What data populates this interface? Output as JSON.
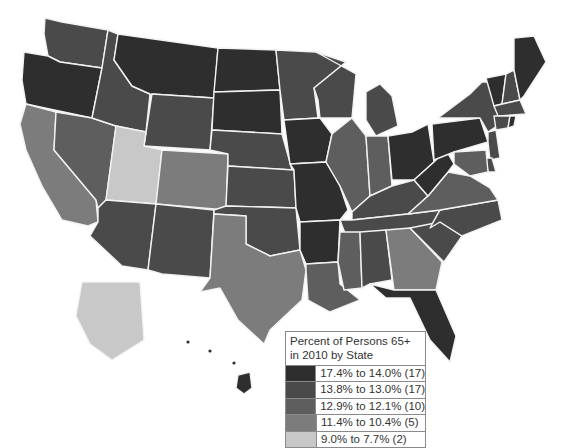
{
  "chart_data": {
    "type": "choropleth",
    "title": "Percent of Persons 65+ in 2010 by State",
    "legend": {
      "title": "Percent of Persons 65+ in 2010 by State",
      "placement": "bottom-right",
      "classes": [
        {
          "id": "c1",
          "label": "17.4% to 14.0% (17)",
          "range": [
            14.0,
            17.4
          ],
          "count": 17,
          "color": "#2e2e2e"
        },
        {
          "id": "c2",
          "label": "13.8% to 13.0% (17)",
          "range": [
            13.0,
            13.8
          ],
          "count": 17,
          "color": "#4a4a4a"
        },
        {
          "id": "c3",
          "label": "12.9% to 12.1% (10)",
          "range": [
            12.1,
            12.9
          ],
          "count": 10,
          "color": "#5e5e5e"
        },
        {
          "id": "c4",
          "label": "11.4% to 10.4% (5)",
          "range": [
            10.4,
            11.4
          ],
          "count": 5,
          "color": "#7c7c7c"
        },
        {
          "id": "c5",
          "label": "9.0% to 7.7% (2)",
          "range": [
            7.7,
            9.0
          ],
          "count": 2,
          "color": "#c8c8c8"
        }
      ]
    },
    "states": {
      "WA": "c2",
      "OR": "c1",
      "CA": "c4",
      "NV": "c3",
      "ID": "c2",
      "MT": "c1",
      "WY": "c2",
      "UT": "c5",
      "AZ": "c2",
      "CO": "c4",
      "NM": "c2",
      "ND": "c1",
      "SD": "c1",
      "NE": "c2",
      "KS": "c2",
      "OK": "c2",
      "TX": "c4",
      "MN": "c2",
      "IA": "c1",
      "MO": "c1",
      "AR": "c1",
      "LA": "c3",
      "WI": "c2",
      "IL": "c3",
      "MI": "c2",
      "IN": "c3",
      "OH": "c1",
      "KY": "c2",
      "TN": "c2",
      "MS": "c3",
      "AL": "c2",
      "GA": "c4",
      "FL": "c1",
      "SC": "c2",
      "NC": "c2",
      "VA": "c3",
      "WV": "c1",
      "PA": "c1",
      "NY": "c2",
      "VT": "c1",
      "NH": "c2",
      "ME": "c1",
      "MA": "c2",
      "CT": "c2",
      "RI": "c1",
      "NJ": "c2",
      "DE": "c2",
      "MD": "c3",
      "AK": "c5",
      "HI": "c1"
    }
  }
}
